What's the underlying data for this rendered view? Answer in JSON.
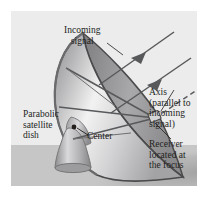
{
  "figure": {
    "background_color": "#ffffff",
    "panel_color": "#ececec",
    "ground_color": "#c6c6c6",
    "ink_color": "#231f1d",
    "ray_color": "#58595b",
    "dish_rim_color": "#4a4a4c",
    "dish_light": "#f3f3f3",
    "dish_dark": "#9a9a9c",
    "shadow_color": "#b0b0b0"
  },
  "labels": {
    "incoming_signal": "Incoming\nsignal",
    "axis": "Axis\n(parallel to\nincoming\nsignal)",
    "receiver": "Receiver\nlocated at\nthe focus",
    "parabolic_dish": "Parabolic\nsatellite\ndish",
    "center": "Center"
  },
  "diagram_parts": {
    "incoming_rays": 2,
    "reflected_rays": 3,
    "axis_line_style": "dashed",
    "receiver_shape": "small-box",
    "pedestal_shape": "rounded-cone",
    "ground_plane": true,
    "shadow": true
  }
}
